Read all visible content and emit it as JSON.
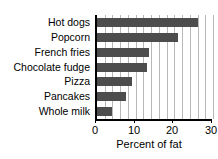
{
  "chart_data": {
    "type": "bar",
    "orientation": "horizontal",
    "title": "Fat content of foods",
    "xlabel": "Percent of fat",
    "ylabel": "",
    "categories": [
      "Hot dogs",
      "Popcorn",
      "French fries",
      "Chocolate fudge",
      "Pizza",
      "Pancakes",
      "Whole milk"
    ],
    "values": [
      26,
      21,
      13.5,
      13,
      9,
      7.5,
      4
    ],
    "xlim": [
      0,
      30
    ],
    "xticks": [
      0,
      10,
      20,
      30
    ],
    "xtick_labels": [
      "0",
      "10",
      "20",
      "30"
    ],
    "grid": true,
    "grid_axis": "x",
    "grid_interval": 2,
    "legend": "none",
    "bar_color": "#4d4d4d",
    "grid_color": "#b8b8b8",
    "axis_color": "#000000",
    "background_color": "#ffffff"
  }
}
